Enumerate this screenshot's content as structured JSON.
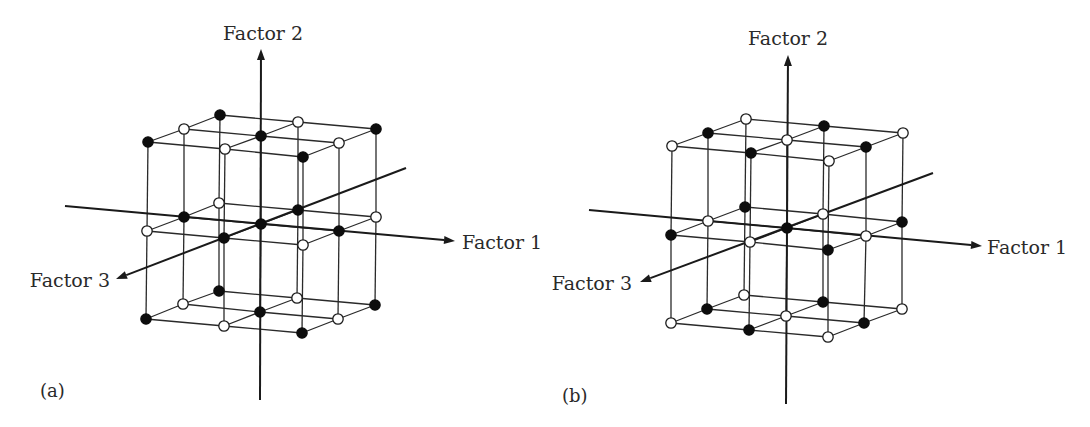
{
  "figure": {
    "width": 1090,
    "height": 427,
    "colors": {
      "ink": "#1a1a1a",
      "filled_node": "#0d0d0d",
      "open_node": "#ffffff",
      "background": "#ffffff"
    }
  },
  "panels": [
    {
      "id": "a",
      "label": "(a)",
      "label_pos": [
        40,
        397
      ],
      "axes": [
        {
          "name": "Factor 1",
          "from": [
            65,
            206
          ],
          "to": [
            455,
            241
          ],
          "label": "Factor 1",
          "label_pos": [
            462,
            249
          ],
          "anchor": "start"
        },
        {
          "name": "Factor 2",
          "from": [
            260,
            400
          ],
          "to": [
            261,
            49
          ],
          "label": "Factor 2",
          "label_pos": [
            263,
            40
          ],
          "anchor": "middle"
        },
        {
          "name": "Factor 3",
          "from": [
            406,
            168
          ],
          "to": [
            116,
            279
          ],
          "label": "Factor 3",
          "label_pos": [
            110,
            287
          ],
          "anchor": "end"
        }
      ],
      "layers": [
        {
          "name": "top",
          "nodes": [
            [
              [
                220,
                115,
                "filled"
              ],
              [
                298,
                122,
                "open"
              ],
              [
                376,
                129,
                "filled"
              ]
            ],
            [
              [
                184,
                129,
                "open"
              ],
              [
                261,
                136,
                "filled"
              ],
              [
                339,
                143,
                "open"
              ]
            ],
            [
              [
                148,
                142,
                "filled"
              ],
              [
                225,
                149,
                "open"
              ],
              [
                303,
                157,
                "filled"
              ]
            ]
          ]
        },
        {
          "name": "middle",
          "nodes": [
            [
              [
                219,
                203,
                "open"
              ],
              [
                298,
                210,
                "filled"
              ],
              [
                376,
                217,
                "open"
              ]
            ],
            [
              [
                184,
                217,
                "filled"
              ],
              [
                261,
                224,
                "filled"
              ],
              [
                339,
                231,
                "filled"
              ]
            ],
            [
              [
                147,
                231,
                "open"
              ],
              [
                224,
                238,
                "filled"
              ],
              [
                303,
                245,
                "open"
              ]
            ]
          ]
        },
        {
          "name": "bottom",
          "nodes": [
            [
              [
                219,
                291,
                "filled"
              ],
              [
                297,
                298,
                "open"
              ],
              [
                375,
                305,
                "filled"
              ]
            ],
            [
              [
                183,
                304,
                "open"
              ],
              [
                260,
                312,
                "filled"
              ],
              [
                338,
                319,
                "open"
              ]
            ],
            [
              [
                146,
                319,
                "filled"
              ],
              [
                224,
                326,
                "open"
              ],
              [
                302,
                333,
                "filled"
              ]
            ]
          ]
        }
      ]
    },
    {
      "id": "b",
      "label": "(b)",
      "label_pos": [
        562,
        402
      ],
      "axes": [
        {
          "name": "Factor 1",
          "from": [
            589,
            210
          ],
          "to": [
            982,
            246
          ],
          "label": "Factor 1",
          "label_pos": [
            987,
            254
          ],
          "anchor": "start"
        },
        {
          "name": "Factor 2",
          "from": [
            786,
            404
          ],
          "to": [
            788,
            55
          ],
          "label": "Factor 2",
          "label_pos": [
            788,
            45
          ],
          "anchor": "middle"
        },
        {
          "name": "Factor 3",
          "from": [
            933,
            173
          ],
          "to": [
            640,
            282
          ],
          "label": "Factor 3",
          "label_pos": [
            632,
            290
          ],
          "anchor": "end"
        }
      ],
      "layers": [
        {
          "name": "top",
          "nodes": [
            [
              [
                746,
                119,
                "open"
              ],
              [
                824,
                126,
                "filled"
              ],
              [
                903,
                133,
                "open"
              ]
            ],
            [
              [
                708,
                133,
                "filled"
              ],
              [
                787,
                140,
                "open"
              ],
              [
                866,
                147,
                "filled"
              ]
            ],
            [
              [
                672,
                146,
                "open"
              ],
              [
                751,
                153,
                "filled"
              ],
              [
                829,
                161,
                "open"
              ]
            ]
          ]
        },
        {
          "name": "middle",
          "nodes": [
            [
              [
                745,
                207,
                "filled"
              ],
              [
                823,
                214,
                "open"
              ],
              [
                902,
                222,
                "filled"
              ]
            ],
            [
              [
                708,
                221,
                "open"
              ],
              [
                787,
                228,
                "filled"
              ],
              [
                866,
                236,
                "open"
              ]
            ],
            [
              [
                671,
                235,
                "filled"
              ],
              [
                750,
                242,
                "open"
              ],
              [
                828,
                250,
                "filled"
              ]
            ]
          ]
        },
        {
          "name": "bottom",
          "nodes": [
            [
              [
                744,
                295,
                "open"
              ],
              [
                823,
                302,
                "filled"
              ],
              [
                902,
                309,
                "open"
              ]
            ],
            [
              [
                707,
                309,
                "filled"
              ],
              [
                786,
                316,
                "open"
              ],
              [
                864,
                323,
                "filled"
              ]
            ],
            [
              [
                671,
                323,
                "open"
              ],
              [
                749,
                330,
                "filled"
              ],
              [
                828,
                337,
                "open"
              ]
            ]
          ]
        }
      ]
    }
  ]
}
